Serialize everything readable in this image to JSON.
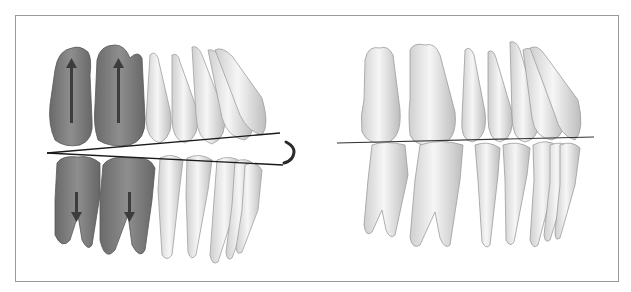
{
  "figure": {
    "panels": [
      {
        "id": "left",
        "description": "Dentition in open/rotated occlusion with highlighted molars and arrows indicating movement",
        "highlight_color": "#6e6e6e",
        "arrows": [
          "upward arrows on upper molars",
          "downward arrows on lower molars"
        ],
        "lines": 2,
        "rotation_indicator": "arc"
      },
      {
        "id": "right",
        "description": "Dentition in closed occlusion with single occlusal plane line",
        "lines": 1
      }
    ],
    "colors": {
      "tooth_fill": "#efefef",
      "tooth_stroke": "#9c9c9c",
      "highlight": "#6f6f6f",
      "line": "#222222",
      "frame": "#9a9a9a"
    }
  }
}
